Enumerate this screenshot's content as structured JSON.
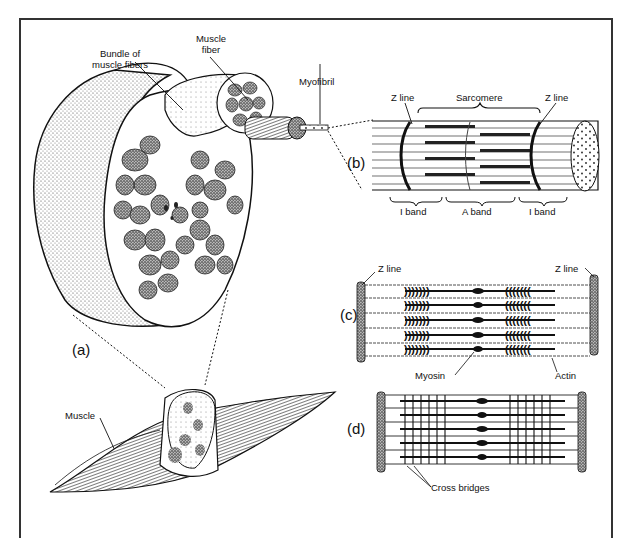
{
  "figure": {
    "panels": [
      {
        "id": "a",
        "label": "(a)"
      },
      {
        "id": "b",
        "label": "(b)"
      },
      {
        "id": "c",
        "label": "(c)"
      },
      {
        "id": "d",
        "label": "(d)"
      }
    ],
    "labels": {
      "bundle": "Bundle of",
      "bundle2": "muscle fibers",
      "fiber": "Muscle",
      "fiber2": "fiber",
      "myofibril": "Myofibril",
      "muscle": "Muscle",
      "zline_b_left": "Z line",
      "zline_b_right": "Z line",
      "sarcomere": "Sarcomere",
      "iband_left": "I band",
      "aband": "A band",
      "iband_right": "I band",
      "zline_c_left": "Z line",
      "zline_c_right": "Z line",
      "myosin": "Myosin",
      "actin": "Actin",
      "cross_bridges": "Cross bridges"
    },
    "colors": {
      "ink": "#111111",
      "stipple": "#555555",
      "background": "#ffffff"
    }
  }
}
